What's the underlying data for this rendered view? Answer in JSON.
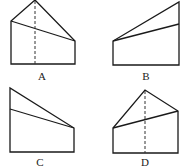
{
  "figures": [
    {
      "label": "A",
      "outline": "11,64 11,21 35,0 75,41 75,64",
      "inner_line": [
        11,
        21,
        75,
        41
      ],
      "dashed_line": [
        35,
        1,
        35,
        64
      ],
      "label_pos": [
        42,
        80
      ]
    },
    {
      "label": "B",
      "outline": "113,65 113,41 179,2 179,65",
      "inner_line": [
        113,
        41,
        179,
        24
      ],
      "dashed_line": null,
      "label_pos": [
        146,
        80
      ]
    },
    {
      "label": "C",
      "outline": "10,152 10,88 74,128 74,152",
      "inner_line": [
        10,
        109,
        74,
        128
      ],
      "dashed_line": null,
      "label_pos": [
        40,
        166
      ]
    },
    {
      "label": "D",
      "outline": "113,153 113,128 145,90 178,111 178,153",
      "inner_line": [
        113,
        128,
        178,
        111
      ],
      "dashed_line": [
        145,
        91,
        145,
        153
      ],
      "label_pos": [
        145,
        166
      ]
    }
  ]
}
